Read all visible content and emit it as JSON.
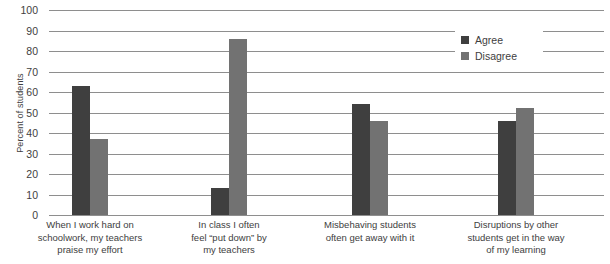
{
  "chart_data": {
    "type": "bar",
    "title": "",
    "xlabel": "",
    "ylabel": "Percent of students",
    "ylim": [
      0,
      100
    ],
    "ytick_step": 10,
    "yticks": [
      "100",
      "90",
      "80",
      "70",
      "60",
      "50",
      "40",
      "30",
      "20",
      "10",
      "0"
    ],
    "grid": true,
    "legend_position": "top-right",
    "categories": [
      "When I work hard on schoolwork, my teachers praise my effort",
      "In class I often feel “put down” by my teachers",
      "Misbehaving students often get away with it",
      "Disruptions by other students get in the way of my learning"
    ],
    "category_lines": [
      [
        "When I work hard on",
        "schoolwork, my teachers",
        "praise my effort"
      ],
      [
        "In class I often",
        "feel “put down” by",
        "my teachers"
      ],
      [
        "Misbehaving students",
        "often get away with it"
      ],
      [
        "Disruptions by other",
        "students get in the way",
        "of my learning"
      ]
    ],
    "series": [
      {
        "name": "Agree",
        "color": "#3f3f3f",
        "values": [
          63,
          13,
          54,
          46
        ]
      },
      {
        "name": "Disagree",
        "color": "#727272",
        "values": [
          37,
          86,
          46,
          52
        ]
      }
    ]
  },
  "legend": {
    "items": [
      {
        "label": "Agree"
      },
      {
        "label": "Disagree"
      }
    ]
  }
}
